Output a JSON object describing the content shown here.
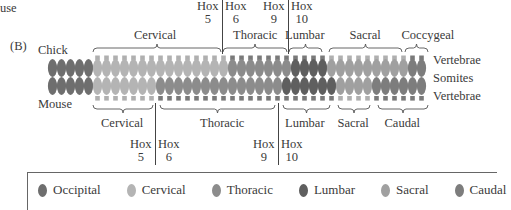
{
  "top_fragment": "use",
  "panel_label": "(B)",
  "species": {
    "top": "Chick",
    "bottom": "Mouse"
  },
  "row_labels": {
    "vertebrae_top": "Vertebrae",
    "somites": "Somites",
    "vertebrae_bottom": "Vertebrae"
  },
  "colors": {
    "occipital": "#6e6e6e",
    "cervical": "#b4b4b4",
    "thoracic": "#8c8c8c",
    "lumbar": "#5f5f5f",
    "sacral": "#a0a0a0",
    "caudal": "#7d7d7d",
    "vertebra_light": "#b0b0b0",
    "vertebra_dark": "#7a7a7a"
  },
  "chick": {
    "regions": [
      {
        "name": "Cervical",
        "label_x": 155,
        "brace_x1": 93,
        "brace_x2": 221
      },
      {
        "name": "Thoracic",
        "label_x": 255,
        "brace_x1": 223,
        "brace_x2": 287
      },
      {
        "name": "Lumbar",
        "label_x": 305,
        "brace_x1": 289,
        "brace_x2": 322
      },
      {
        "name": "Sacral",
        "label_x": 365,
        "brace_x1": 329,
        "brace_x2": 402
      },
      {
        "name": "Coccygeal",
        "label_x": 428,
        "brace_x1": 405,
        "brace_x2": 428
      }
    ],
    "hox": [
      {
        "left": "Hox",
        "left_num": "5",
        "right": "Hox",
        "right_num": "6",
        "x": 222
      },
      {
        "left": "Hox",
        "left_num": "9",
        "right": "Hox",
        "right_num": "10",
        "x": 288
      }
    ]
  },
  "mouse": {
    "regions": [
      {
        "name": "Cervical",
        "label_x": 122,
        "brace_x1": 93,
        "brace_x2": 153
      },
      {
        "name": "Thoracic",
        "label_x": 222,
        "brace_x1": 160,
        "brace_x2": 275
      },
      {
        "name": "Lumbar",
        "label_x": 305,
        "brace_x1": 283,
        "brace_x2": 330
      },
      {
        "name": "Sacral",
        "label_x": 353,
        "brace_x1": 338,
        "brace_x2": 370
      },
      {
        "name": "Caudal",
        "label_x": 402,
        "brace_x1": 378,
        "brace_x2": 428
      }
    ],
    "hox": [
      {
        "left": "Hox",
        "left_num": "5",
        "right": "Hox",
        "right_num": "6",
        "x": 155
      },
      {
        "left": "Hox",
        "left_num": "9",
        "right": "Hox",
        "right_num": "10",
        "x": 278
      }
    ]
  },
  "legend": [
    {
      "label": "Occipital",
      "color": "#6e6e6e"
    },
    {
      "label": "Cervical",
      "color": "#b4b4b4"
    },
    {
      "label": "Thoracic",
      "color": "#8c8c8c"
    },
    {
      "label": "Lumbar",
      "color": "#5f5f5f"
    },
    {
      "label": "Sacral",
      "color": "#a0a0a0"
    },
    {
      "label": "Caudal",
      "color": "#7d7d7d"
    }
  ]
}
